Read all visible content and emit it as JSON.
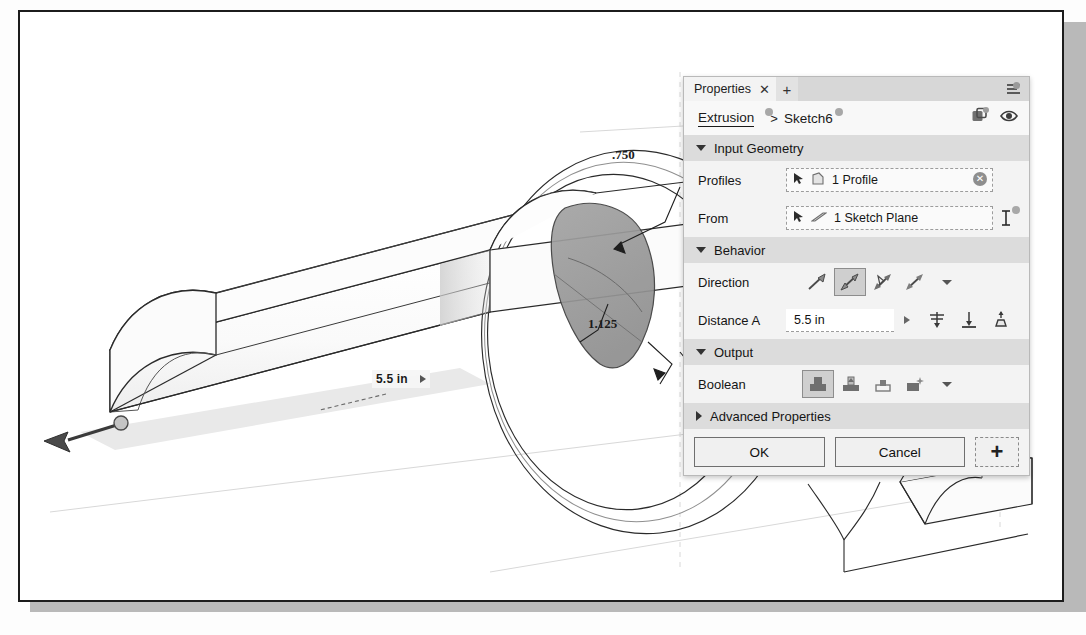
{
  "app": {
    "kind": "cad-extrusion-dialog"
  },
  "viewport": {
    "dimensions": [
      {
        "id": "length",
        "value": "5.5 in",
        "has_caret": true
      },
      {
        "id": "width",
        "value": "1.125",
        "has_caret": false
      },
      {
        "id": "thickness",
        "value": ".750",
        "has_caret": false
      }
    ]
  },
  "panel": {
    "tab": {
      "label": "Properties",
      "close_label": "✕",
      "add_label": "+"
    },
    "breadcrumb": {
      "parent": "Extrusion",
      "separator": ">",
      "current": "Sketch6"
    },
    "sections": [
      {
        "id": "input-geometry",
        "title": "Input Geometry",
        "expanded": true,
        "rows": [
          {
            "id": "profiles",
            "label": "Profiles",
            "value": "1 Profile",
            "has_clear": true
          },
          {
            "id": "from",
            "label": "From",
            "value": "1 Sketch Plane",
            "has_clear": false
          }
        ]
      },
      {
        "id": "behavior",
        "title": "Behavior",
        "expanded": true,
        "direction": {
          "label": "Direction",
          "options": [
            "one-side",
            "two-sides-asymmetric",
            "symmetric",
            "two-directions"
          ],
          "selected_index": 1
        },
        "distance": {
          "label": "Distance A",
          "value": "5.5 in",
          "icons": [
            "midplane-icon",
            "to-object-icon",
            "taper-icon"
          ]
        }
      },
      {
        "id": "output",
        "title": "Output",
        "expanded": true,
        "boolean": {
          "label": "Boolean",
          "options": [
            "join",
            "cut",
            "intersect",
            "new-body"
          ],
          "selected_index": 0
        }
      },
      {
        "id": "advanced-properties",
        "title": "Advanced Properties",
        "expanded": false
      }
    ],
    "footer": {
      "ok_label": "OK",
      "cancel_label": "Cancel",
      "plus_label": "+"
    }
  },
  "colors": {
    "panel_bg": "#f3f3f3",
    "section_bg": "#dcdcdc",
    "tabbar_bg": "#d7d7d7",
    "selected_icon_bg": "#cfcfcf",
    "profile_fill": "#9d9d9d",
    "line": "#2a2a2a"
  }
}
